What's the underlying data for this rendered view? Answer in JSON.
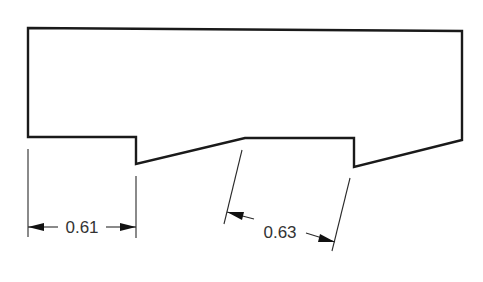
{
  "drawing": {
    "type": "technical-drawing",
    "outline_points": "28,28 462,31 462,140 354,167 354,138 245,138 136,164 136,137 28,137",
    "colors": {
      "outline": "#1a1a1a",
      "dimension": "#2a2a2a",
      "text": "#333333",
      "background": "#ffffff"
    }
  },
  "dimensions": [
    {
      "id": "dim-left",
      "label": "0.61",
      "orientation": "horizontal"
    },
    {
      "id": "dim-right",
      "label": "0.63",
      "orientation": "slanted"
    }
  ]
}
